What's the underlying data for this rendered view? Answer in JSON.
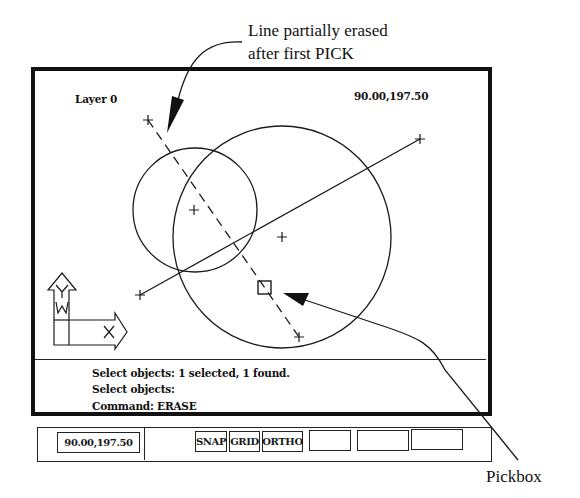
{
  "annotations": {
    "top_callout_line1": "Line partially erased",
    "top_callout_line2": "after first PICK",
    "pickbox_label": "Pickbox"
  },
  "drawing_area": {
    "layer_label": "Layer 0",
    "coordinates": "90.00,197.50",
    "ucs_icon": {
      "y_label": "Y",
      "x_label": "X",
      "w_label": "W"
    }
  },
  "command_area": {
    "lines": [
      "Select objects: 1 selected, 1 found.",
      "Select objects:",
      "Command: ERASE"
    ]
  },
  "status_bar": {
    "coordinates": "90.00,197.50",
    "toggles": [
      {
        "label": "SNAP"
      },
      {
        "label": "GRID"
      },
      {
        "label": "ORTHO"
      },
      {
        "label": ""
      },
      {
        "label": ""
      },
      {
        "label": ""
      }
    ]
  },
  "colors": {
    "ink": "#111111",
    "background": "#ffffff"
  }
}
